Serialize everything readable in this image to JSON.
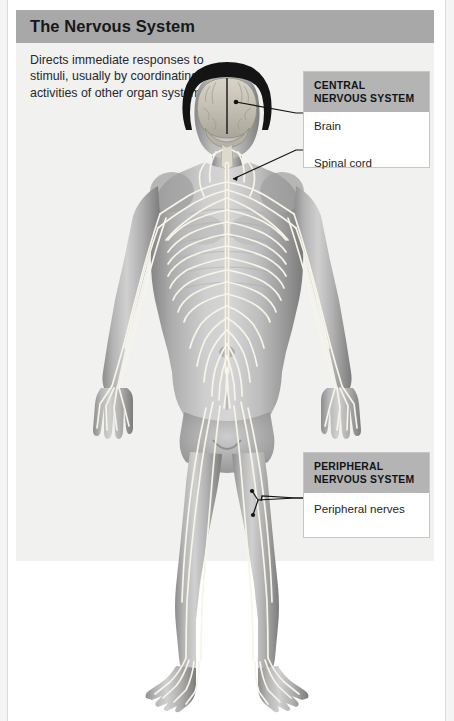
{
  "panel": {
    "title": "The Nervous System",
    "description": "Directs immediate responses to stimuli, usually by coordinating the activities of other organ systems"
  },
  "callouts": {
    "central": {
      "header": "CENTRAL NERVOUS SYSTEM",
      "items": [
        {
          "label": "Brain"
        },
        {
          "label": "Spinal cord"
        }
      ]
    },
    "peripheral": {
      "header": "PERIPHERAL NERVOUS SYSTEM",
      "items": [
        {
          "label": "Peripheral nerves"
        }
      ]
    }
  },
  "figure": {
    "alt_name": "human-body-nervous-system-anatomical-illustration",
    "view": "anterior full-body",
    "structures": [
      "brain",
      "spinal cord",
      "cranial nerves",
      "brachial plexus",
      "intercostal nerves",
      "lumbar plexus",
      "sciatic nerve",
      "femoral nerve",
      "tibial nerve",
      "peroneal nerve"
    ]
  },
  "colors": {
    "panel_background": "#f1f1f0",
    "header_bar": "#a8a8a8",
    "callout_header": "#b4b4b4",
    "callout_body": "#ffffff",
    "callout_border": "#c6c6c6",
    "text": "#1d1f22",
    "nerve": "#f6f3e8",
    "skin_light": "#cfcfcf",
    "skin_mid": "#9a9a9a",
    "skin_dark": "#6e6e6e",
    "hair": "#1a1a1a",
    "leader_line": "#1a1a1a"
  }
}
